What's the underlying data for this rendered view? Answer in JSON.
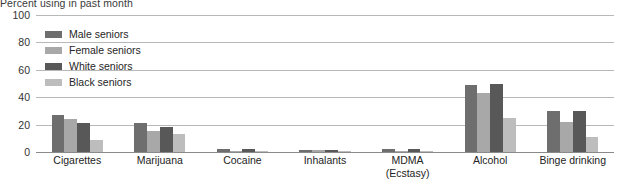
{
  "chart_data": {
    "type": "bar",
    "title": "Percent using in past month",
    "xlabel": "",
    "ylabel": "",
    "ylim": [
      0,
      100
    ],
    "yticks": [
      0,
      20,
      40,
      60,
      80,
      100
    ],
    "grid": true,
    "legend_position": "upper-left-inside",
    "categories": [
      "Cigarettes",
      "Marijuana",
      "Cocaine",
      "Inhalants",
      "MDMA (Ecstasy)",
      "Alcohol",
      "Binge drinking"
    ],
    "category_lines": [
      [
        "Cigarettes",
        ""
      ],
      [
        "Marijuana",
        ""
      ],
      [
        "Cocaine",
        ""
      ],
      [
        "Inhalants",
        ""
      ],
      [
        "MDMA",
        "(Ecstasy)"
      ],
      [
        "Alcohol",
        ""
      ],
      [
        "Binge drinking",
        ""
      ]
    ],
    "series": [
      {
        "name": "Male seniors",
        "color": "#6e6e6e",
        "values": [
          27,
          21,
          2,
          1.5,
          2,
          49,
          30
        ]
      },
      {
        "name": "Female seniors",
        "color": "#a8a8a8",
        "values": [
          24,
          15,
          1,
          1.5,
          1,
          43,
          22
        ]
      },
      {
        "name": "White seniors",
        "color": "#585858",
        "values": [
          21,
          18,
          2,
          1.5,
          2,
          50,
          30
        ]
      },
      {
        "name": "Black seniors",
        "color": "#bdbdbd",
        "values": [
          9,
          13,
          0.5,
          1,
          0.5,
          25,
          11
        ]
      }
    ]
  },
  "axis": {
    "ytick_labels": [
      "100",
      "80",
      "60",
      "40",
      "20",
      "0"
    ]
  },
  "legend": {
    "items": [
      {
        "label": "Male seniors",
        "color": "#6e6e6e"
      },
      {
        "label": "Female seniors",
        "color": "#a8a8a8"
      },
      {
        "label": "White seniors",
        "color": "#585858"
      },
      {
        "label": "Black seniors",
        "color": "#bdbdbd"
      }
    ]
  }
}
